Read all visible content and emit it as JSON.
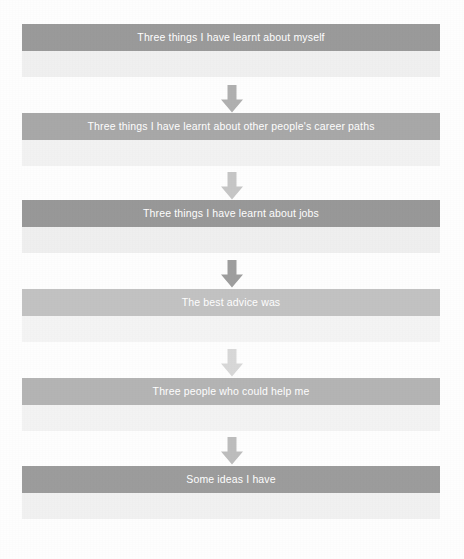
{
  "document": {
    "title": "Careers reflection flowchart",
    "background_color": "#fefefe"
  },
  "flow": {
    "arrow_icon_name": "arrow-down-icon",
    "steps": [
      {
        "index": 1,
        "label": "Three things I have learnt about myself",
        "header_color": "#9a9a9a",
        "body_color": "#f0f0f0",
        "top": 24,
        "arrow_color": "#b0b0b0"
      },
      {
        "index": 2,
        "label": "Three things I have learnt about other people's career paths",
        "header_color": "#a8a8a8",
        "body_color": "#f2f2f2",
        "top": 113,
        "arrow_color": "#c6c6c6"
      },
      {
        "index": 3,
        "label": "Three things I have learnt about jobs",
        "header_color": "#989898",
        "body_color": "#efefef",
        "top": 200,
        "arrow_color": "#9e9e9e"
      },
      {
        "index": 4,
        "label": "The best advice was",
        "header_color": "#c2c2c2",
        "body_color": "#f4f4f4",
        "top": 289,
        "arrow_color": "#d8d8d8"
      },
      {
        "index": 5,
        "label": "Three people who could help me",
        "header_color": "#b4b4b4",
        "body_color": "#f3f3f3",
        "top": 378,
        "arrow_color": "#bdbdbd"
      },
      {
        "index": 6,
        "label": "Some ideas I have",
        "header_color": "#9c9c9c",
        "body_color": "#f1f1f1",
        "top": 466,
        "arrow_color": null
      }
    ],
    "arrows": [
      {
        "index": 1,
        "from_step": 1,
        "to_step": 2,
        "top": 84,
        "color": "#b0b0b0"
      },
      {
        "index": 2,
        "from_step": 2,
        "to_step": 3,
        "top": 171,
        "color": "#c6c6c6"
      },
      {
        "index": 3,
        "from_step": 3,
        "to_step": 4,
        "top": 259,
        "color": "#9e9e9e"
      },
      {
        "index": 4,
        "from_step": 4,
        "to_step": 5,
        "top": 348,
        "color": "#d8d8d8"
      },
      {
        "index": 5,
        "from_step": 5,
        "to_step": 6,
        "top": 436,
        "color": "#bdbdbd"
      }
    ]
  }
}
